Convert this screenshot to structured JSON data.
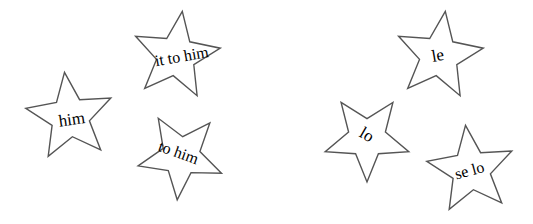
{
  "diagram": {
    "stroke_color": "#555555",
    "text_color": "#000000",
    "background": "#ffffff",
    "groups": [
      {
        "name": "english-pronouns",
        "stars": [
          {
            "id": "star-him",
            "label": "him",
            "cx": 70,
            "cy": 117,
            "r": 45,
            "rot": -7,
            "tx": 72,
            "ty": 121,
            "trot": -8,
            "fs": 17
          },
          {
            "id": "star-it-to-him",
            "label": "it to him",
            "cx": 176,
            "cy": 56,
            "r": 45,
            "rot": 8,
            "tx": 182,
            "ty": 58,
            "trot": -10,
            "fs": 16
          },
          {
            "id": "star-to-him",
            "label": "to him",
            "cx": 181,
            "cy": 156,
            "r": 44,
            "rot": 41,
            "tx": 178,
            "ty": 154,
            "trot": 20,
            "fs": 16
          }
        ]
      },
      {
        "name": "spanish-pronouns",
        "stars": [
          {
            "id": "star-le",
            "label": "le",
            "cx": 439,
            "cy": 56,
            "r": 45,
            "rot": 8,
            "tx": 438,
            "ty": 57,
            "trot": -10,
            "fs": 17
          },
          {
            "id": "star-lo",
            "label": "lo",
            "cx": 367,
            "cy": 138,
            "r": 44,
            "rot": -36,
            "tx": 366,
            "ty": 136,
            "trot": 30,
            "fs": 17
          },
          {
            "id": "star-se-lo",
            "label": "se lo",
            "cx": 471,
            "cy": 170,
            "r": 45,
            "rot": -7,
            "tx": 470,
            "ty": 172,
            "trot": -15,
            "fs": 16
          }
        ]
      }
    ]
  }
}
